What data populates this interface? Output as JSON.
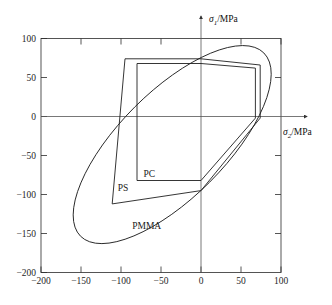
{
  "chart_data": {
    "type": "line",
    "title": "",
    "subtitle": "",
    "xlabel": "σ₂/MPa",
    "ylabel": "σ₁/MPa",
    "xlabel_symbol": "σ",
    "xlabel_subscript": "2",
    "xlabel_unit": "/MPa",
    "ylabel_symbol": "σ",
    "ylabel_subscript": "1",
    "ylabel_unit": "/MPa",
    "xlim": [
      -200,
      100
    ],
    "ylim": [
      -200,
      100
    ],
    "xticks": [
      -200,
      -150,
      -100,
      -50,
      0,
      50,
      100
    ],
    "xtick_labels": [
      "−200",
      "−150",
      "−100",
      "−50",
      "0",
      "50",
      "100"
    ],
    "yticks": [
      -200,
      -150,
      -100,
      -50,
      0,
      50,
      100
    ],
    "ytick_labels": [
      "−200",
      "−150",
      "−100",
      "−50",
      "0",
      "50",
      "100"
    ],
    "grid": false,
    "legend_position": "inline-annotations",
    "series": [
      {
        "name": "PC",
        "label": "PC",
        "shape": "hexagon",
        "closed": true,
        "label_point": [
          -72,
          -78
        ],
        "points": [
          [
            -80,
            0
          ],
          [
            -80,
            68
          ],
          [
            0,
            68
          ],
          [
            68,
            62
          ],
          [
            68,
            -2
          ],
          [
            0,
            -2
          ],
          [
            -80,
            -82
          ],
          [
            -80,
            0
          ]
        ],
        "vertices": [
          [
            -80,
            68
          ],
          [
            0,
            68
          ],
          [
            68,
            62
          ],
          [
            68,
            -2
          ],
          [
            0,
            -82
          ],
          [
            -80,
            -82
          ]
        ]
      },
      {
        "name": "PS",
        "label": "PS",
        "shape": "hexagon",
        "closed": true,
        "label_point": [
          -104,
          -96
        ],
        "vertices": [
          [
            -95,
            74
          ],
          [
            0,
            74
          ],
          [
            74,
            66
          ],
          [
            74,
            -2
          ],
          [
            0,
            -95
          ],
          [
            -111,
            -112
          ]
        ]
      },
      {
        "name": "PMMA",
        "label": "PMMA",
        "shape": "ellipse",
        "closed": true,
        "label_point": [
          -86,
          -144
        ],
        "ellipse": {
          "center_x": -36,
          "center_y": -36,
          "semi_major": 162,
          "semi_minor": 68,
          "rotation_deg": -45,
          "extremes": {
            "x_min": -155,
            "x_max": 84,
            "y_min": -158,
            "y_max": 85
          }
        }
      }
    ],
    "annotations": [
      {
        "text": "PC",
        "x": -72,
        "y": -78
      },
      {
        "text": "PS",
        "x": -104,
        "y": -96
      },
      {
        "text": "PMMA",
        "x": -86,
        "y": -144
      }
    ]
  },
  "colors": {
    "background": "#ffffff",
    "curve": "#1f1f1f",
    "frame": "#2b2b2b",
    "axis": "#555555",
    "text": "#1a1a1a"
  }
}
